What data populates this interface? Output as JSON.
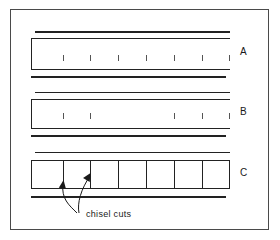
{
  "figure": {
    "background_color": "#ffffff",
    "line_color": "#222222",
    "frame_color": "#4a4a4a",
    "width": 280,
    "height": 240
  },
  "panels": [
    {
      "id": "A",
      "label": "A",
      "label_x": 240,
      "label_y": 47,
      "body_left": 31,
      "body_right": 229,
      "rules": [
        {
          "y": 31,
          "thickness": 2,
          "x1": 35,
          "x2": 230
        },
        {
          "y": 38,
          "thickness": 1,
          "x1": 31,
          "x2": 230
        },
        {
          "y": 69,
          "thickness": 1,
          "x1": 31,
          "x2": 230
        },
        {
          "y": 76,
          "thickness": 2,
          "x1": 31,
          "x2": 226
        }
      ],
      "left_edge": {
        "x": 31,
        "y1": 38,
        "y2": 69,
        "thickness": 1
      },
      "ticks": {
        "y_top": 55,
        "height": 6,
        "x_positions": [
          63,
          90,
          118,
          146,
          174,
          202,
          229
        ]
      },
      "tick_count": 7,
      "description": "uncut blade edge with evenly spaced chisel cut marks"
    },
    {
      "id": "B",
      "label": "B",
      "label_x": 240,
      "label_y": 107,
      "body_left": 31,
      "body_right": 229,
      "rules": [
        {
          "y": 92,
          "thickness": 1,
          "x1": 35,
          "x2": 230
        },
        {
          "y": 99,
          "thickness": 1,
          "x1": 31,
          "x2": 230
        },
        {
          "y": 128,
          "thickness": 1,
          "x1": 31,
          "x2": 230
        },
        {
          "y": 135,
          "thickness": 2,
          "x1": 31,
          "x2": 226
        }
      ],
      "left_edge": {
        "x": 31,
        "y1": 99,
        "y2": 128,
        "thickness": 1
      },
      "ticks": {
        "y_top": 113,
        "height": 6,
        "x_positions": [
          63,
          90,
          174,
          202,
          229
        ]
      },
      "tick_count": 5,
      "description": "blade with central chisel cut marks removed"
    },
    {
      "id": "C",
      "label": "C",
      "label_x": 240,
      "label_y": 168,
      "body_left": 31,
      "body_right": 229,
      "rules": [
        {
          "y": 152,
          "thickness": 1,
          "x1": 35,
          "x2": 230
        },
        {
          "y": 160,
          "thickness": 1,
          "x1": 31,
          "x2": 230
        },
        {
          "y": 188,
          "thickness": 1,
          "x1": 31,
          "x2": 230
        },
        {
          "y": 196,
          "thickness": 2,
          "x1": 31,
          "x2": 226
        }
      ],
      "left_edge": {
        "x": 31,
        "y1": 160,
        "y2": 188,
        "thickness": 1
      },
      "dividers": {
        "y_top": 160,
        "y_bottom": 188,
        "x_positions": [
          63,
          90,
          118,
          146,
          174,
          202
        ],
        "count": 6
      },
      "segment_count": 7,
      "description": "blade fully separated into segments by chisel cuts"
    }
  ],
  "annotation": {
    "caption": "chisel cuts",
    "caption_x": 86,
    "caption_y": 214,
    "arrow_targets": [
      {
        "x": 63,
        "y": 181
      },
      {
        "x": 90,
        "y": 175
      }
    ]
  }
}
